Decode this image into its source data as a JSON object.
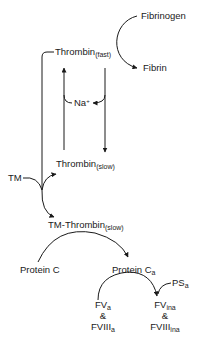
{
  "diagram": {
    "nodes": {
      "fibrinogen": {
        "label": "Fibrinogen"
      },
      "fibrin": {
        "label": "Fibrin"
      },
      "thrombin_fast": {
        "label": "Thrombin",
        "subscript": "(fast)"
      },
      "sodium": {
        "label": "Na",
        "superscript": "+"
      },
      "thrombin_slow": {
        "label": "Thrombin",
        "subscript": "(slow)"
      },
      "tm": {
        "label": "TM"
      },
      "tm_thrombin_slow": {
        "label": "TM-Thrombin",
        "subscript": "(slow)"
      },
      "protein_c": {
        "label": "Protein C"
      },
      "protein_ca": {
        "label": "Protein C",
        "subscript": "a"
      },
      "ps_a": {
        "label": "PS",
        "subscript": "a"
      },
      "fv_a": {
        "label": "FV",
        "subscript": "a"
      },
      "and_1": {
        "label": "&"
      },
      "fviii_a": {
        "label": "FVIII",
        "subscript": "a"
      },
      "fv_ina": {
        "label": "FV",
        "subscript": "ina"
      },
      "and_2": {
        "label": "&"
      },
      "fviii_ina": {
        "label": "FVIII",
        "subscript": "ina"
      }
    },
    "edges": [
      {
        "from": "Fibrinogen",
        "to": "Fibrin",
        "via": "Thrombin(fast)"
      },
      {
        "from": "Thrombin(slow)",
        "to": "Thrombin(fast)",
        "via": "Na+"
      },
      {
        "from": "Thrombin(fast)",
        "to": "Thrombin(slow)",
        "releases": "Na+"
      },
      {
        "from": "Thrombin(fast)",
        "to": "TM-Thrombin(slow)",
        "via": "TM"
      },
      {
        "from": "TM",
        "to": "Thrombin(slow)"
      },
      {
        "from": "Protein C",
        "to": "Protein Ca",
        "via": "TM-Thrombin(slow)"
      },
      {
        "from": "FVa & FVIIIa",
        "to": "FVina & FVIIIina",
        "via": "Protein Ca + PSa"
      }
    ],
    "stroke_color": "#1a1a1a"
  }
}
